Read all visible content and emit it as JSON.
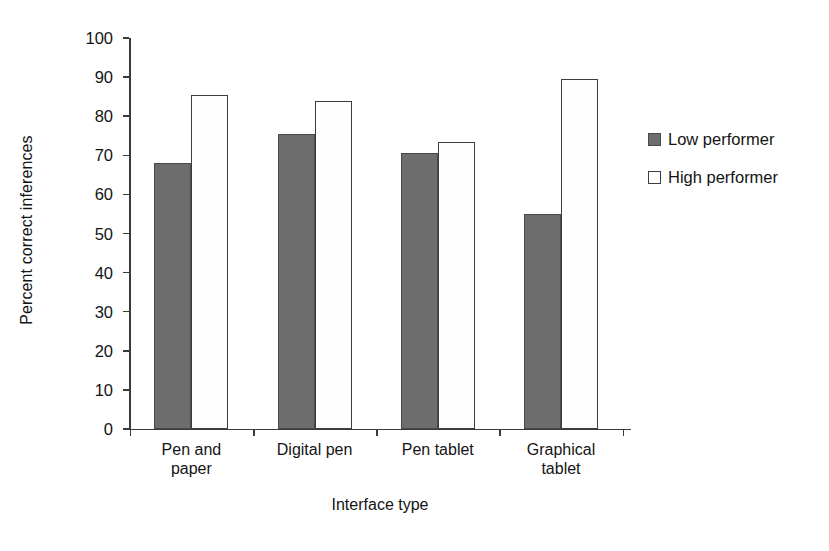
{
  "chart_data": {
    "type": "bar",
    "title": "",
    "xlabel": "Interface type",
    "ylabel": "Percent correct inferences",
    "categories": [
      "Pen and paper",
      "Digital pen",
      "Pen tablet",
      "Graphical tablet"
    ],
    "category_lines": [
      [
        "Pen and",
        "paper"
      ],
      [
        "Digital pen",
        ""
      ],
      [
        "Pen tablet",
        ""
      ],
      [
        "Graphical",
        "tablet"
      ]
    ],
    "series": [
      {
        "name": "Low performer",
        "color": "#6d6d6d",
        "values": [
          68,
          75.5,
          70.5,
          55
        ]
      },
      {
        "name": "High performer",
        "color": "#ffffff",
        "values": [
          85.5,
          84,
          73.5,
          89.5
        ]
      }
    ],
    "ylim": [
      0,
      100
    ],
    "ytick_values": [
      0,
      10,
      20,
      30,
      40,
      50,
      60,
      70,
      80,
      90,
      100
    ],
    "ytick_labels": [
      "0",
      "10",
      "20",
      "30",
      "40",
      "50",
      "60",
      "70",
      "80",
      "90",
      "100"
    ],
    "grid": false,
    "legend_position": "right"
  },
  "legend": {
    "items": [
      {
        "label": "Low performer",
        "swatch": "filled-gray-square-icon"
      },
      {
        "label": "High performer",
        "swatch": "open-white-square-icon"
      }
    ]
  },
  "colors": {
    "low_performer": "#6d6d6d",
    "high_performer": "#ffffff",
    "axis": "#3a3a3a",
    "text": "#141414",
    "background": "#ffffff"
  }
}
